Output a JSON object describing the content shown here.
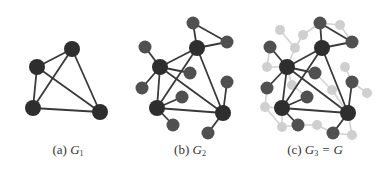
{
  "colors": {
    "background": "#ffffff",
    "big_node": "#2e2e2e",
    "small_node": "#505050",
    "faded_node": "#cfcfcf",
    "edge": "#3a3a3a",
    "faded_edge": "#d2d2d2",
    "caption": "#333333"
  },
  "captions": [
    {
      "prefix": "(a) ",
      "var": "G",
      "sub": "1",
      "suffix": "",
      "x": 68
    },
    {
      "prefix": "(b) ",
      "var": "G",
      "sub": "2",
      "suffix": "",
      "x": 190
    },
    {
      "prefix": "(c) ",
      "var": "G",
      "sub": "3",
      "suffix": " = G",
      "x": 315
    }
  ],
  "graphs": [
    {
      "name": "G1",
      "nodes": [
        {
          "id": "t",
          "x": 72,
          "y": 49,
          "r": 8,
          "kind": "big"
        },
        {
          "id": "l",
          "x": 37,
          "y": 67,
          "r": 8,
          "kind": "big"
        },
        {
          "id": "bl",
          "x": 33,
          "y": 108,
          "r": 8,
          "kind": "big"
        },
        {
          "id": "br",
          "x": 100,
          "y": 112,
          "r": 8,
          "kind": "big"
        }
      ],
      "edges": [
        [
          "t",
          "l"
        ],
        [
          "t",
          "bl"
        ],
        [
          "t",
          "br"
        ],
        [
          "l",
          "bl"
        ],
        [
          "l",
          "br"
        ],
        [
          "bl",
          "br"
        ]
      ],
      "faded_nodes": [],
      "faded_edges": []
    },
    {
      "name": "G2",
      "nodes": [
        {
          "id": "T",
          "x": 197,
          "y": 48,
          "r": 8,
          "kind": "big"
        },
        {
          "id": "L",
          "x": 160,
          "y": 67,
          "r": 8,
          "kind": "big"
        },
        {
          "id": "BL",
          "x": 157,
          "y": 108,
          "r": 8,
          "kind": "big"
        },
        {
          "id": "BR",
          "x": 223,
          "y": 113,
          "r": 8,
          "kind": "big"
        },
        {
          "id": "s1",
          "x": 193,
          "y": 23,
          "r": 6.5,
          "kind": "small"
        },
        {
          "id": "s2",
          "x": 227,
          "y": 42,
          "r": 6.5,
          "kind": "small"
        },
        {
          "id": "s3",
          "x": 145,
          "y": 47,
          "r": 6.5,
          "kind": "small"
        },
        {
          "id": "s4",
          "x": 190,
          "y": 73,
          "r": 6.5,
          "kind": "small"
        },
        {
          "id": "s5",
          "x": 142,
          "y": 88,
          "r": 6.5,
          "kind": "small"
        },
        {
          "id": "s6",
          "x": 227,
          "y": 82,
          "r": 6.5,
          "kind": "small"
        },
        {
          "id": "s7",
          "x": 182,
          "y": 97,
          "r": 6.5,
          "kind": "small"
        },
        {
          "id": "s8",
          "x": 173,
          "y": 125,
          "r": 6.5,
          "kind": "small"
        },
        {
          "id": "s9",
          "x": 208,
          "y": 133,
          "r": 6.5,
          "kind": "small"
        }
      ],
      "edges": [
        [
          "T",
          "L"
        ],
        [
          "T",
          "BL"
        ],
        [
          "T",
          "BR"
        ],
        [
          "L",
          "BL"
        ],
        [
          "L",
          "BR"
        ],
        [
          "BL",
          "BR"
        ],
        [
          "T",
          "s1"
        ],
        [
          "T",
          "s2"
        ],
        [
          "s1",
          "s2"
        ],
        [
          "L",
          "s3"
        ],
        [
          "L",
          "s4"
        ],
        [
          "L",
          "s5"
        ],
        [
          "BR",
          "s6"
        ],
        [
          "BL",
          "s7"
        ],
        [
          "BL",
          "s8"
        ],
        [
          "BR",
          "s9"
        ]
      ],
      "faded_nodes": [],
      "faded_edges": []
    },
    {
      "name": "G3",
      "nodes": [
        {
          "id": "T",
          "x": 322,
          "y": 48,
          "r": 8,
          "kind": "big"
        },
        {
          "id": "L",
          "x": 287,
          "y": 67,
          "r": 8,
          "kind": "big"
        },
        {
          "id": "BL",
          "x": 282,
          "y": 108,
          "r": 8,
          "kind": "big"
        },
        {
          "id": "BR",
          "x": 348,
          "y": 113,
          "r": 8,
          "kind": "big"
        },
        {
          "id": "s1",
          "x": 320,
          "y": 23,
          "r": 6.5,
          "kind": "small"
        },
        {
          "id": "s2",
          "x": 352,
          "y": 42,
          "r": 6.5,
          "kind": "small"
        },
        {
          "id": "s3",
          "x": 270,
          "y": 47,
          "r": 6.5,
          "kind": "small"
        },
        {
          "id": "s4",
          "x": 315,
          "y": 73,
          "r": 6.5,
          "kind": "small"
        },
        {
          "id": "s5",
          "x": 267,
          "y": 88,
          "r": 6.5,
          "kind": "small"
        },
        {
          "id": "s6",
          "x": 352,
          "y": 82,
          "r": 6.5,
          "kind": "small"
        },
        {
          "id": "s7",
          "x": 307,
          "y": 97,
          "r": 6.5,
          "kind": "small"
        },
        {
          "id": "s8",
          "x": 298,
          "y": 125,
          "r": 6.5,
          "kind": "small"
        },
        {
          "id": "s9",
          "x": 333,
          "y": 133,
          "r": 6.5,
          "kind": "small"
        }
      ],
      "edges": [
        [
          "T",
          "L"
        ],
        [
          "T",
          "BL"
        ],
        [
          "T",
          "BR"
        ],
        [
          "L",
          "BL"
        ],
        [
          "L",
          "BR"
        ],
        [
          "BL",
          "BR"
        ],
        [
          "T",
          "s1"
        ],
        [
          "T",
          "s2"
        ],
        [
          "s1",
          "s2"
        ],
        [
          "L",
          "s3"
        ],
        [
          "L",
          "s4"
        ],
        [
          "L",
          "s5"
        ],
        [
          "BR",
          "s6"
        ],
        [
          "BL",
          "s7"
        ],
        [
          "BL",
          "s8"
        ],
        [
          "BR",
          "s9"
        ]
      ],
      "faded_nodes": [
        {
          "id": "f1",
          "x": 280,
          "y": 30
        },
        {
          "id": "f2",
          "x": 303,
          "y": 35
        },
        {
          "id": "f3",
          "x": 295,
          "y": 48
        },
        {
          "id": "f4",
          "x": 267,
          "y": 67
        },
        {
          "id": "f5",
          "x": 340,
          "y": 25
        },
        {
          "id": "f6",
          "x": 345,
          "y": 67
        },
        {
          "id": "f7",
          "x": 367,
          "y": 93
        },
        {
          "id": "f8",
          "x": 332,
          "y": 90
        },
        {
          "id": "f9",
          "x": 352,
          "y": 135
        },
        {
          "id": "f10",
          "x": 265,
          "y": 107
        },
        {
          "id": "f11",
          "x": 292,
          "y": 85
        },
        {
          "id": "f12",
          "x": 282,
          "y": 127
        },
        {
          "id": "f13",
          "x": 317,
          "y": 125
        }
      ],
      "faded_edges": [
        [
          "f1",
          "f3"
        ],
        [
          "f2",
          "f3"
        ],
        [
          "f2",
          "s1"
        ],
        [
          "f3",
          "L"
        ],
        [
          "f4",
          "L"
        ],
        [
          "f4",
          "s3"
        ],
        [
          "f5",
          "s1"
        ],
        [
          "f5",
          "s2"
        ],
        [
          "f6",
          "s6"
        ],
        [
          "f7",
          "s6"
        ],
        [
          "f8",
          "s4"
        ],
        [
          "f8",
          "BR"
        ],
        [
          "f9",
          "BR"
        ],
        [
          "f9",
          "s9"
        ],
        [
          "f10",
          "s5"
        ],
        [
          "f10",
          "BL"
        ],
        [
          "f11",
          "L"
        ],
        [
          "f11",
          "s7"
        ],
        [
          "f12",
          "BL"
        ],
        [
          "f12",
          "s8"
        ],
        [
          "f13",
          "s8"
        ],
        [
          "f13",
          "s9"
        ],
        [
          "f10",
          "f12"
        ]
      ]
    }
  ]
}
